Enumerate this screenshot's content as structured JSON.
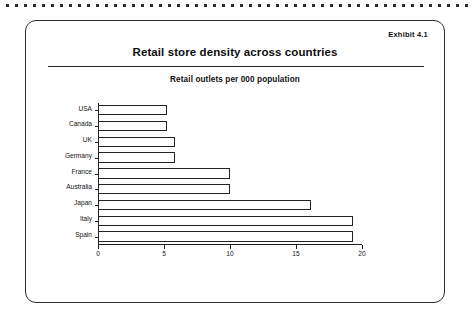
{
  "scan_artifact": {
    "name": "dotted-scan-line"
  },
  "card": {
    "exhibit_label": "Exhibit 4.1",
    "title": "Retail store density across countries",
    "subtitle": "Retail outlets per 000 population"
  },
  "chart_data": {
    "type": "bar",
    "orientation": "horizontal",
    "title": "Retail store density across countries",
    "subtitle": "Retail outlets per 000 population",
    "xlabel": "",
    "ylabel": "",
    "xlim": [
      0,
      20
    ],
    "xticks": [
      0,
      5,
      10,
      15,
      20
    ],
    "xticklabels": [
      "0",
      "5",
      "10",
      "15",
      "20"
    ],
    "grid": false,
    "legend": false,
    "bar_fill": "#ffffff",
    "bar_edge": "#232323",
    "categories": [
      "USA",
      "Canada",
      "UK",
      "Germany",
      "France",
      "Australia",
      "Japan",
      "Italy",
      "Spain"
    ],
    "values": [
      5.2,
      5.2,
      5.8,
      5.8,
      10.0,
      10.0,
      16.1,
      19.3,
      19.3
    ]
  }
}
